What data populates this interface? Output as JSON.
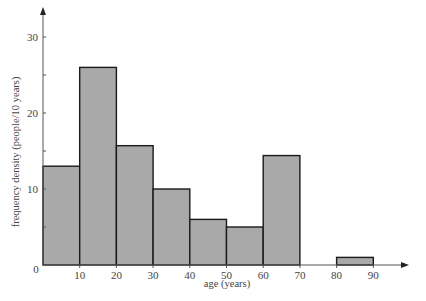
{
  "chart_data": {
    "type": "bar",
    "subtype": "histogram",
    "title": "",
    "xlabel": "age (years)",
    "ylabel": "frequency density (people/10 years)",
    "bins": [
      {
        "start": 0,
        "end": 10,
        "value": 13
      },
      {
        "start": 10,
        "end": 20,
        "value": 26
      },
      {
        "start": 20,
        "end": 30,
        "value": 15.7
      },
      {
        "start": 30,
        "end": 40,
        "value": 10
      },
      {
        "start": 40,
        "end": 50,
        "value": 6
      },
      {
        "start": 50,
        "end": 60,
        "value": 5
      },
      {
        "start": 60,
        "end": 70,
        "value": 14.4
      },
      {
        "start": 70,
        "end": 80,
        "value": 0
      },
      {
        "start": 80,
        "end": 90,
        "value": 1
      }
    ],
    "categories": [
      "0-10",
      "10-20",
      "20-30",
      "30-40",
      "40-50",
      "50-60",
      "60-70",
      "70-80",
      "80-90"
    ],
    "values": [
      13,
      26,
      15.7,
      10,
      6,
      5,
      14.4,
      0,
      1
    ],
    "x_ticks": [
      "10",
      "20",
      "30",
      "40",
      "50",
      "60",
      "70",
      "80",
      "90"
    ],
    "y_ticks": [
      "0",
      "10",
      "20",
      "30"
    ],
    "xlim": [
      0,
      97
    ],
    "ylim": [
      0,
      30
    ],
    "grid": false,
    "legend": null,
    "bar_color": "#a9a9a9",
    "edge_color": "#1a1a1a"
  }
}
